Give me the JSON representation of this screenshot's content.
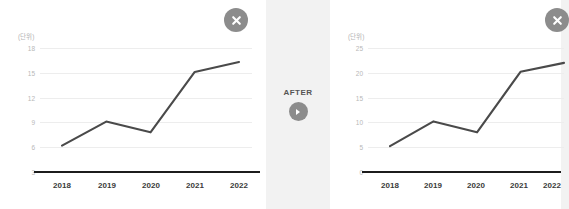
{
  "background_color": "#f2f2f2",
  "panel_color": "#ffffff",
  "accent_color": "#8c8c8c",
  "line_color": "#4a4a4a",
  "middle": {
    "label": "AFTER",
    "arrow_icon": "circle-arrow-right-icon"
  },
  "panels": [
    {
      "id": "before",
      "close_icon": "close-icon",
      "unit_label": "(단위)"
    },
    {
      "id": "after",
      "close_icon": "close-icon",
      "unit_label": "(단위)"
    }
  ],
  "chart_data": [
    {
      "type": "line",
      "title": "",
      "subtitle": "",
      "xlabel": "",
      "ylabel": "(단위)",
      "categories": [
        "2018",
        "2019",
        "2020",
        "2021",
        "2022"
      ],
      "values": [
        6.2,
        9.1,
        7.8,
        15.1,
        16.3
      ],
      "yticks": [
        18,
        15,
        12,
        9,
        6,
        3
      ],
      "ylim": [
        3,
        18
      ],
      "grid": true,
      "legend": "none",
      "series_name": ""
    },
    {
      "type": "line",
      "title": "",
      "subtitle": "",
      "xlabel": "",
      "ylabel": "(단위)",
      "categories": [
        "2018",
        "2019",
        "2020",
        "2021",
        "2022"
      ],
      "values": [
        5.2,
        10.2,
        8.0,
        20.2,
        22.0
      ],
      "yticks": [
        25,
        20,
        15,
        10,
        5,
        0
      ],
      "ylim": [
        0,
        25
      ],
      "grid": true,
      "legend": "none",
      "series_name": ""
    }
  ]
}
